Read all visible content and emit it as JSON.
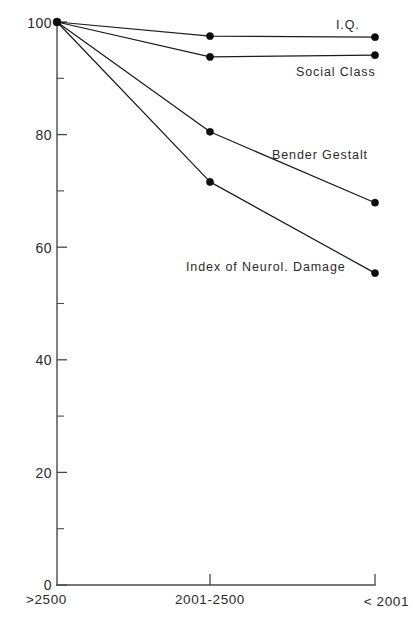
{
  "chart_data": {
    "type": "line",
    "title": "",
    "subtitle": "",
    "xlabel": "",
    "ylabel": "",
    "categories": [
      ">2500",
      "2001-2500",
      "< 2001"
    ],
    "ylim": [
      0,
      100
    ],
    "xlim": [
      0,
      2
    ],
    "grid": false,
    "legend_position": "inline-right",
    "y_major_ticks": [
      0,
      20,
      40,
      60,
      80,
      100
    ],
    "y_major_tick_labels": [
      "0",
      "20",
      "40",
      "60",
      "80",
      "100"
    ],
    "y_minor_ticks": [
      10,
      30,
      50,
      70,
      90
    ],
    "series": [
      {
        "name": "I.Q.",
        "label": "I.Q.",
        "values": [
          100,
          97.5,
          97.3
        ],
        "marker": "filled-circle",
        "color": "#0d0d0d"
      },
      {
        "name": "Social Class",
        "label": "Social Class",
        "values": [
          100,
          93.8,
          94.1
        ],
        "marker": "filled-circle",
        "color": "#0d0d0d"
      },
      {
        "name": "Bender Gestalt",
        "label": "Bender Gestalt",
        "values": [
          100,
          80.5,
          67.9
        ],
        "marker": "filled-circle",
        "color": "#0d0d0d"
      },
      {
        "name": "Index of Neurol. Damage",
        "label": "Index of Neurol. Damage",
        "values": [
          100,
          71.6,
          55.4
        ],
        "marker": "filled-circle",
        "color": "#0d0d0d"
      }
    ],
    "annotations": [
      {
        "text": "I.Q.",
        "x_px": 336,
        "y_px": 29,
        "series": "I.Q."
      },
      {
        "text": "Social Class",
        "x_px": 296,
        "y_px": 76,
        "series": "Social Class"
      },
      {
        "text": "Bender Gestalt",
        "x_px": 272,
        "y_px": 159,
        "series": "Bender Gestalt"
      },
      {
        "text": "Index of Neurol. Damage",
        "x_px": 186,
        "y_px": 271,
        "series": "Index of Neurol. Damage"
      }
    ],
    "colors": {
      "background": "#ffffff",
      "axis": "#4a4a4a",
      "line": "#1c1c1c",
      "marker": "#0d0d0d",
      "text": "#2a2a2a"
    }
  },
  "artifact": {
    "top_scan_text": "scanned page header artifact"
  }
}
